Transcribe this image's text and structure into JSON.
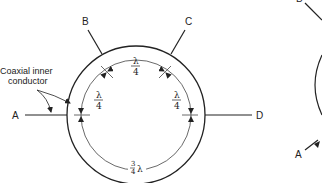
{
  "diagram": {
    "type": "coaxial hybrid ring (rat-race) junction",
    "annotation_label": {
      "line1": "Coaxial inner",
      "line2": "conductor"
    },
    "ports": [
      {
        "id": "A",
        "label": "A",
        "position": "left"
      },
      {
        "id": "B",
        "label": "B",
        "position": "upper-left"
      },
      {
        "id": "C",
        "label": "C",
        "position": "upper-right"
      },
      {
        "id": "D",
        "label": "D",
        "position": "right"
      }
    ],
    "segments": [
      {
        "between": [
          "A",
          "B"
        ],
        "label_num": "λ",
        "label_den": "4"
      },
      {
        "between": [
          "B",
          "C"
        ],
        "label_num": "λ",
        "label_den": "4"
      },
      {
        "between": [
          "C",
          "D"
        ],
        "label_num": "λ",
        "label_den": "4"
      },
      {
        "between": [
          "D",
          "A"
        ],
        "label_num": "3",
        "label_den": "4",
        "label_suffix": "λ"
      }
    ],
    "partial_figure": {
      "labels": [
        {
          "id": "B",
          "label": "B"
        },
        {
          "id": "A",
          "label": "A"
        }
      ]
    },
    "colors": {
      "line": "#222222",
      "background": "#ffffff"
    }
  }
}
